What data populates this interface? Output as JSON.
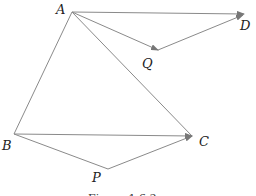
{
  "figure": {
    "caption": "Figure 1.6.3",
    "points": {
      "A": {
        "label": "A",
        "x": 72,
        "y": 12
      },
      "D": {
        "label": "D",
        "x": 244,
        "y": 14
      },
      "Q": {
        "label": "Q",
        "x": 158,
        "y": 50
      },
      "B": {
        "label": "B",
        "x": 14,
        "y": 134
      },
      "C": {
        "label": "C",
        "x": 192,
        "y": 136
      },
      "P": {
        "label": "P",
        "x": 108,
        "y": 169
      }
    },
    "segments": [
      {
        "from": "A",
        "to": "D",
        "arrow": true
      },
      {
        "from": "A",
        "to": "Q",
        "arrow": true
      },
      {
        "from": "Q",
        "to": "D",
        "arrow": true
      },
      {
        "from": "A",
        "to": "C",
        "arrow": false
      },
      {
        "from": "A",
        "to": "B",
        "arrow": false
      },
      {
        "from": "B",
        "to": "C",
        "arrow": true
      },
      {
        "from": "B",
        "to": "P",
        "arrow": false
      },
      {
        "from": "P",
        "to": "C",
        "arrow": true
      }
    ],
    "line_color": "#8a8a8a"
  }
}
